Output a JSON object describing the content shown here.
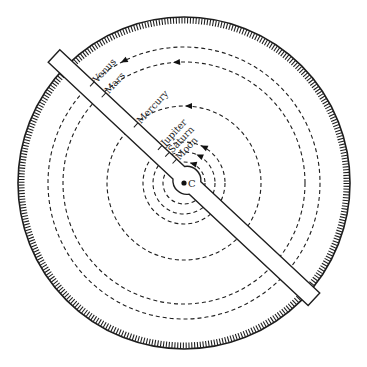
{
  "diagram": {
    "center_label": "C",
    "center": {
      "x": 184,
      "y": 183
    },
    "outer_dial": {
      "radius": 166,
      "tick_count": 360,
      "tick_length": 6,
      "color": "#222222"
    },
    "orbits": [
      {
        "name": "Moon",
        "radius": 21,
        "arrow_at": {
          "x": 190,
          "y": 162
        }
      },
      {
        "name": "Saturn",
        "radius": 31,
        "arrow_at": {
          "x": 197,
          "y": 153
        }
      },
      {
        "name": "Jupiter",
        "radius": 41,
        "arrow_at": {
          "x": 201,
          "y": 145
        }
      },
      {
        "name": "Mercury",
        "radius": 77,
        "arrow_at": {
          "x": 185,
          "y": 106
        }
      },
      {
        "name": "Mars",
        "radius": 121,
        "arrow_at": {
          "x": 173,
          "y": 62
        }
      },
      {
        "name": "Venus",
        "radius": 136,
        "arrow_at": {
          "x": 121,
          "y": 63
        }
      }
    ],
    "ruler": {
      "start": {
        "x": 54,
        "y": 56
      },
      "angle_deg": 43.1,
      "length": 356,
      "width": 17,
      "hub_offset": 182,
      "hub_radius": 14,
      "labels": [
        {
          "text": "Venus",
          "pos": 47
        },
        {
          "text": "Mars",
          "pos": 63
        },
        {
          "text": "Mercury",
          "pos": 107
        },
        {
          "text": "Jupiter",
          "pos": 140
        },
        {
          "text": "Saturn",
          "pos": 150
        },
        {
          "text": "Moon",
          "pos": 160
        }
      ]
    },
    "line_color": "#1e1e1e"
  }
}
